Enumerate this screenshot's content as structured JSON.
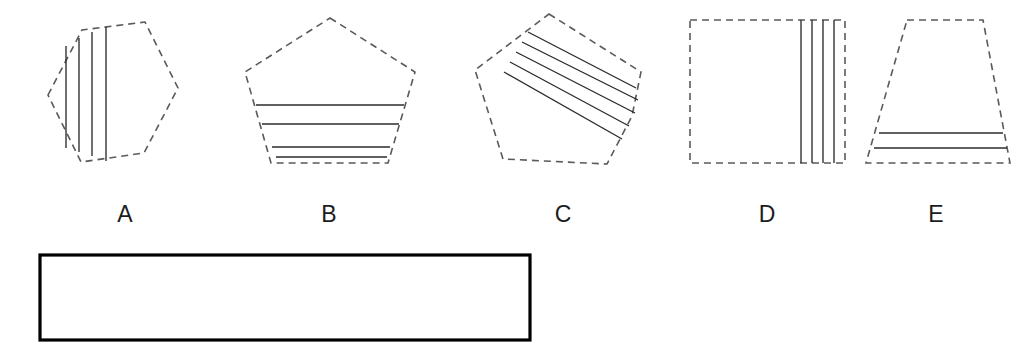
{
  "page": {
    "background_color": "#ffffff",
    "width": 1036,
    "height": 358,
    "outline_stroke_color": "#5a5a5a",
    "hatch_stroke_color": "#2b2b2b",
    "answer_box_stroke_color": "#000000"
  },
  "figure": {
    "shapes": [
      {
        "id": "A",
        "label": "A",
        "polygon_name": "hexagon",
        "outline_style": "dashed",
        "outline_points": "48,95 82,30 145,22 178,88 144,153 81,162",
        "hatch_orientation": "vertical",
        "hatch_count": 4,
        "hatch_lines": [
          "66,46 66,148",
          "79,38 79,152",
          "92,32 92,156",
          "106,27 106,161"
        ],
        "label_x": 95,
        "label_y": 203
      },
      {
        "id": "B",
        "label": "B",
        "polygon_name": "pentagon",
        "outline_style": "dashed",
        "outline_points": "330,18 415,72 388,163 271,163 245,72",
        "hatch_orientation": "horizontal",
        "hatch_count": 4,
        "hatch_lines": [
          "256,105 404,105",
          "262,124 399,124",
          "272,147 390,147",
          "276,157 387,157"
        ],
        "label_x": 299,
        "label_y": 203
      },
      {
        "id": "C",
        "label": "C",
        "polygon_name": "pentagon-rotated",
        "outline_style": "dashed",
        "outline_points": "549,14 641,72 632,116 607,164 503,159 475,70",
        "hatch_orientation": "diagonal",
        "hatch_count": 5,
        "hatch_lines": [
          "528,32 636,88",
          "522,42 638,100",
          "516,52 635,113",
          "510,62 629,126",
          "504,72 622,139"
        ],
        "label_x": 533,
        "label_y": 203
      },
      {
        "id": "D",
        "label": "D",
        "polygon_name": "square",
        "outline_style": "dashed",
        "outline_points": "690,20 845,20 845,163 690,163",
        "hatch_orientation": "vertical",
        "hatch_count": 4,
        "hatch_lines": [
          "801,20 801,163",
          "812,20 812,163",
          "823,20 823,163",
          "834,20 834,163"
        ],
        "label_x": 737,
        "label_y": 203
      },
      {
        "id": "E",
        "label": "E",
        "polygon_name": "trapezoid",
        "outline_style": "dashed",
        "outline_points": "907,20 983,20 1010,163 866,163",
        "hatch_orientation": "horizontal",
        "hatch_count": 2,
        "hatch_lines": [
          "879,133 1003,133",
          "874,148 1007,148"
        ],
        "label_x": 906,
        "label_y": 203
      }
    ],
    "answer_box": {
      "x": 40,
      "y": 255,
      "width": 490,
      "height": 85,
      "content": "",
      "border_style": "solid"
    }
  }
}
